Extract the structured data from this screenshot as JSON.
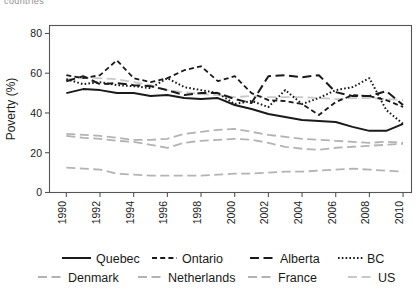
{
  "top_clipped_text": "countries",
  "axes": {
    "ylabel": "Poverty (%)",
    "xlabel": "",
    "yticks": [
      "0",
      "20",
      "40",
      "60",
      "80"
    ],
    "xticks": [
      "1990",
      "1992",
      "1994",
      "1996",
      "1998",
      "2000",
      "2002",
      "2004",
      "2006",
      "2008",
      "2010"
    ]
  },
  "legend": {
    "entries": [
      {
        "label": "Quebec",
        "color": "#1a1a1a",
        "dash": "none"
      },
      {
        "label": "Ontario",
        "color": "#1a1a1a",
        "dash": "short"
      },
      {
        "label": "Alberta",
        "color": "#1a1a1a",
        "dash": "long"
      },
      {
        "label": "BC",
        "color": "#1a1a1a",
        "dash": "dot"
      },
      {
        "label": "Denmark",
        "color": "#b3b3b3",
        "dash": "long"
      },
      {
        "label": "Netherlands",
        "color": "#b3b3b3",
        "dash": "long"
      },
      {
        "label": "France",
        "color": "#b3b3b3",
        "dash": "long"
      },
      {
        "label": "US",
        "color": "#c9c9c9",
        "dash": "long"
      }
    ]
  },
  "chart_data": {
    "type": "line",
    "title": "",
    "xlabel": "",
    "ylabel": "Poverty (%)",
    "xlim": [
      1989,
      2010.5
    ],
    "ylim": [
      0,
      84
    ],
    "grid": false,
    "legend_position": "bottom",
    "x": [
      1990,
      1991,
      1992,
      1993,
      1994,
      1995,
      1996,
      1997,
      1998,
      1999,
      2000,
      2001,
      2002,
      2003,
      2004,
      2005,
      2006,
      2007,
      2008,
      2009,
      2010
    ],
    "series": [
      {
        "name": "Quebec",
        "color": "#1a1a1a",
        "dash": "none",
        "width": 2.0,
        "values": [
          50.0,
          52.0,
          51.5,
          50.0,
          50.0,
          48.5,
          49.0,
          47.5,
          47.0,
          47.5,
          44.0,
          42.0,
          39.5,
          38.0,
          36.5,
          36.0,
          35.5,
          33.0,
          31.0,
          31.0,
          34.5
        ]
      },
      {
        "name": "Ontario",
        "color": "#1a1a1a",
        "dash": "short",
        "width": 1.8,
        "values": [
          59.0,
          57.5,
          59.0,
          66.5,
          57.5,
          55.5,
          57.5,
          61.5,
          63.5,
          56.0,
          58.5,
          50.0,
          46.5,
          46.0,
          44.5,
          39.0,
          45.5,
          49.0,
          48.5,
          46.5,
          43.0
        ]
      },
      {
        "name": "Alberta",
        "color": "#1a1a1a",
        "dash": "long",
        "width": 2.0,
        "values": [
          56.0,
          58.5,
          54.5,
          55.0,
          54.0,
          53.5,
          51.5,
          49.0,
          50.0,
          50.0,
          47.0,
          45.0,
          58.5,
          59.0,
          58.0,
          59.0,
          50.5,
          48.5,
          48.5,
          51.0,
          44.0
        ]
      },
      {
        "name": "BC",
        "color": "#1a1a1a",
        "dash": "dot",
        "width": 2.0,
        "values": [
          57.0,
          54.5,
          55.5,
          54.0,
          53.5,
          52.5,
          57.5,
          53.0,
          51.5,
          50.0,
          44.5,
          46.0,
          43.0,
          51.5,
          44.5,
          47.5,
          51.5,
          53.0,
          57.5,
          41.5,
          34.5
        ]
      },
      {
        "name": "Denmark",
        "color": "#b3b3b3",
        "dash": "long",
        "width": 1.8,
        "values": [
          12.5,
          12.0,
          11.5,
          9.5,
          9.0,
          8.5,
          8.5,
          8.5,
          8.5,
          9.0,
          9.5,
          9.5,
          10.0,
          10.5,
          10.5,
          11.0,
          11.5,
          12.0,
          11.5,
          11.0,
          10.5
        ]
      },
      {
        "name": "Netherlands",
        "color": "#b3b3b3",
        "dash": "long",
        "width": 1.8,
        "values": [
          28.5,
          27.5,
          27.0,
          26.0,
          25.5,
          24.0,
          22.5,
          25.0,
          26.0,
          26.5,
          27.0,
          26.5,
          25.0,
          23.0,
          22.0,
          21.5,
          22.5,
          23.0,
          23.5,
          24.0,
          24.5
        ]
      },
      {
        "name": "France",
        "color": "#b3b3b3",
        "dash": "long",
        "width": 1.8,
        "values": [
          29.5,
          29.0,
          28.5,
          27.5,
          26.5,
          26.5,
          27.0,
          29.5,
          30.5,
          31.5,
          32.0,
          30.5,
          29.0,
          28.0,
          27.0,
          26.5,
          26.0,
          25.5,
          25.0,
          25.5,
          25.0
        ]
      },
      {
        "name": "US",
        "color": "#c9c9c9",
        "dash": "long",
        "width": 1.8,
        "values": [
          57.0,
          57.5,
          57.5,
          57.0,
          55.5,
          54.0,
          51.5,
          50.5,
          49.5,
          49.0,
          48.0,
          48.5,
          48.0,
          48.0,
          48.0,
          47.5,
          47.0,
          47.5,
          47.5,
          47.0,
          46.5
        ]
      }
    ]
  }
}
